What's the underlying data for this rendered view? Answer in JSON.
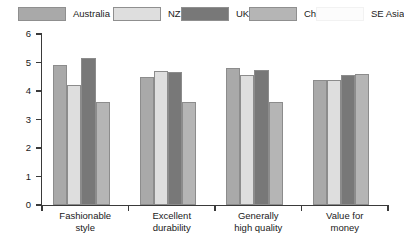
{
  "chart_data": {
    "type": "bar",
    "title": "",
    "subtitle": "",
    "xlabel": "",
    "ylabel": "",
    "ylim": [
      0,
      6
    ],
    "yticks": [
      "0",
      "1",
      "2",
      "3",
      "4",
      "5",
      "6"
    ],
    "grid": false,
    "legend_position": "top",
    "categories": [
      "Fashionable style",
      "Excellent durability",
      "Generally high quality",
      "Value for money"
    ],
    "category_lines": [
      [
        "Fashionable",
        "style"
      ],
      [
        "Excellent",
        "durability"
      ],
      [
        "Generally",
        "high quality"
      ],
      [
        "Value for",
        "money"
      ]
    ],
    "series": [
      {
        "name": "Australia",
        "color": "#a9a9a9",
        "values": [
          4.9,
          4.5,
          4.8,
          4.4
        ]
      },
      {
        "name": "NZ",
        "color": "#dedede",
        "values": [
          4.2,
          4.7,
          4.55,
          4.4
        ]
      },
      {
        "name": "UK",
        "color": "#787878",
        "values": [
          5.15,
          4.65,
          4.75,
          4.55
        ]
      },
      {
        "name": "China",
        "color": "#b5b5b5",
        "values": [
          3.6,
          3.6,
          3.6,
          4.6
        ]
      },
      {
        "name": "SE Asia",
        "color": "#fcfcfc",
        "values": [
          0,
          0,
          0,
          0
        ]
      }
    ]
  },
  "legend": {
    "items": [
      {
        "label": "Australia",
        "color": "#a9a9a9"
      },
      {
        "label": "NZ",
        "color": "#dedede"
      },
      {
        "label": "UK",
        "color": "#787878"
      },
      {
        "label": "China",
        "color": "#b5b5b5"
      },
      {
        "label": "SE Asia",
        "color": "#fcfcfc"
      }
    ]
  },
  "axis": {
    "y_min_label": "0",
    "y_max_label": "6"
  }
}
